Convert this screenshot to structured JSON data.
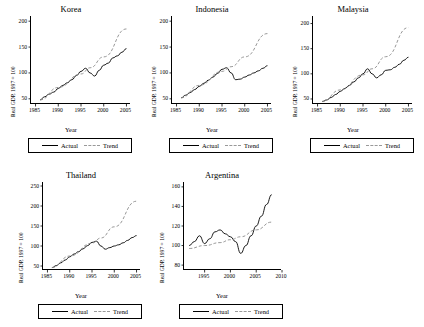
{
  "legend": {
    "actual_label": "Actual",
    "trend_label": "Trend"
  },
  "common": {
    "ylabel": "Real GDP, 1997 = 100",
    "xlabel": "Year"
  },
  "chart_data": [
    {
      "type": "line",
      "title": "Korea",
      "xlabel": "Year",
      "ylabel": "Real GDP, 1997 = 100",
      "xlim": [
        1984,
        2006
      ],
      "ylim": [
        40,
        210
      ],
      "xticks": [
        1985,
        1990,
        1995,
        2000,
        2005
      ],
      "yticks": [
        50,
        100,
        150,
        200
      ],
      "grid": false,
      "legend_position": "below",
      "series": [
        {
          "name": "Actual",
          "style": "solid",
          "x": [
            1986,
            1987,
            1988,
            1989,
            1990,
            1991,
            1992,
            1993,
            1994,
            1995,
            1996,
            1997,
            1998,
            1999,
            2000,
            2001,
            2002,
            2003,
            2004,
            2005
          ],
          "y": [
            48,
            54,
            59,
            63,
            70,
            76,
            81,
            87,
            95,
            103,
            109,
            100,
            94,
            105,
            115,
            119,
            129,
            133,
            140,
            147
          ]
        },
        {
          "name": "Trend",
          "style": "dashed",
          "x": [
            1986,
            1990,
            1995,
            1997,
            2000,
            2005
          ],
          "y": [
            48,
            72,
            98,
            110,
            131,
            185
          ]
        }
      ]
    },
    {
      "type": "line",
      "title": "Indonesia",
      "xlabel": "Year",
      "ylabel": "Real GDP, 1997 = 100",
      "xlim": [
        1984,
        2006
      ],
      "ylim": [
        40,
        210
      ],
      "xticks": [
        1985,
        1990,
        1995,
        2000,
        2005
      ],
      "yticks": [
        50,
        100,
        150,
        200
      ],
      "grid": false,
      "legend_position": "below",
      "series": [
        {
          "name": "Actual",
          "style": "solid",
          "x": [
            1986,
            1987,
            1988,
            1989,
            1990,
            1991,
            1992,
            1993,
            1994,
            1995,
            1996,
            1997,
            1998,
            1999,
            2000,
            2001,
            2002,
            2003,
            2004,
            2005
          ],
          "y": [
            52,
            57,
            62,
            68,
            74,
            80,
            86,
            92,
            99,
            107,
            110,
            100,
            87,
            88,
            92,
            96,
            100,
            104,
            109,
            114
          ]
        },
        {
          "name": "Trend",
          "style": "dashed",
          "x": [
            1986,
            1990,
            1995,
            1997,
            2000,
            2005
          ],
          "y": [
            52,
            76,
            103,
            112,
            131,
            176
          ]
        }
      ]
    },
    {
      "type": "line",
      "title": "Malaysia",
      "xlabel": "Year",
      "ylabel": "Real GDP, 1997 = 100",
      "xlim": [
        1984,
        2006
      ],
      "ylim": [
        40,
        215
      ],
      "xticks": [
        1985,
        1990,
        1995,
        2000,
        2005
      ],
      "yticks": [
        50,
        100,
        150,
        200
      ],
      "grid": false,
      "legend_position": "below",
      "series": [
        {
          "name": "Actual",
          "style": "solid",
          "x": [
            1986,
            1987,
            1988,
            1989,
            1990,
            1991,
            1992,
            1993,
            1994,
            1995,
            1996,
            1997,
            1998,
            1999,
            2000,
            2001,
            2002,
            2003,
            2004,
            2005
          ],
          "y": [
            45,
            48,
            53,
            59,
            65,
            71,
            77,
            84,
            92,
            100,
            110,
            100,
            92,
            98,
            107,
            108,
            113,
            119,
            127,
            133
          ]
        },
        {
          "name": "Trend",
          "style": "dashed",
          "x": [
            1986,
            1990,
            1995,
            1997,
            2000,
            2005
          ],
          "y": [
            45,
            68,
            98,
            110,
            134,
            192
          ]
        }
      ]
    },
    {
      "type": "line",
      "title": "Thailand",
      "xlabel": "Year",
      "ylabel": "Real GDP, 1997 = 100",
      "xlim": [
        1984,
        2006
      ],
      "ylim": [
        40,
        260
      ],
      "xticks": [
        1985,
        1990,
        1995,
        2000,
        2005
      ],
      "yticks": [
        50,
        100,
        150,
        200,
        250
      ],
      "grid": false,
      "legend_position": "below",
      "series": [
        {
          "name": "Actual",
          "style": "solid",
          "x": [
            1986,
            1987,
            1988,
            1989,
            1990,
            1991,
            1992,
            1993,
            1994,
            1995,
            1996,
            1997,
            1998,
            1999,
            2000,
            2001,
            2002,
            2003,
            2004,
            2005
          ],
          "y": [
            46,
            51,
            58,
            65,
            73,
            80,
            86,
            93,
            101,
            109,
            112,
            100,
            92,
            96,
            100,
            103,
            108,
            114,
            121,
            126
          ]
        },
        {
          "name": "Trend",
          "style": "dashed",
          "x": [
            1986,
            1990,
            1995,
            1997,
            2000,
            2005
          ],
          "y": [
            46,
            75,
            107,
            120,
            148,
            212
          ]
        }
      ]
    },
    {
      "type": "line",
      "title": "Argentina",
      "xlabel": "Year",
      "ylabel": "Real GDP, 1997 = 100",
      "xlim": [
        1991,
        2010
      ],
      "ylim": [
        75,
        165
      ],
      "xticks": [
        1990,
        1995,
        2000,
        2005,
        2010
      ],
      "yticks": [
        80,
        100,
        120,
        140,
        160
      ],
      "grid": false,
      "legend_position": "below",
      "series": [
        {
          "name": "Actual",
          "style": "solid",
          "x": [
            1992,
            1993,
            1994,
            1995,
            1996,
            1997,
            1998,
            1999,
            2000,
            2001,
            2002,
            2003,
            2004,
            2005,
            2006,
            2007,
            2008
          ],
          "y": [
            100,
            104,
            110,
            102,
            107,
            114,
            116,
            112,
            109,
            104,
            92,
            100,
            110,
            120,
            130,
            142,
            152
          ]
        },
        {
          "name": "Trend",
          "style": "dashed",
          "x": [
            1992,
            1995,
            1998,
            2000,
            2002,
            2005,
            2008
          ],
          "y": [
            97,
            100,
            103,
            106,
            109,
            116,
            124
          ]
        }
      ]
    }
  ]
}
